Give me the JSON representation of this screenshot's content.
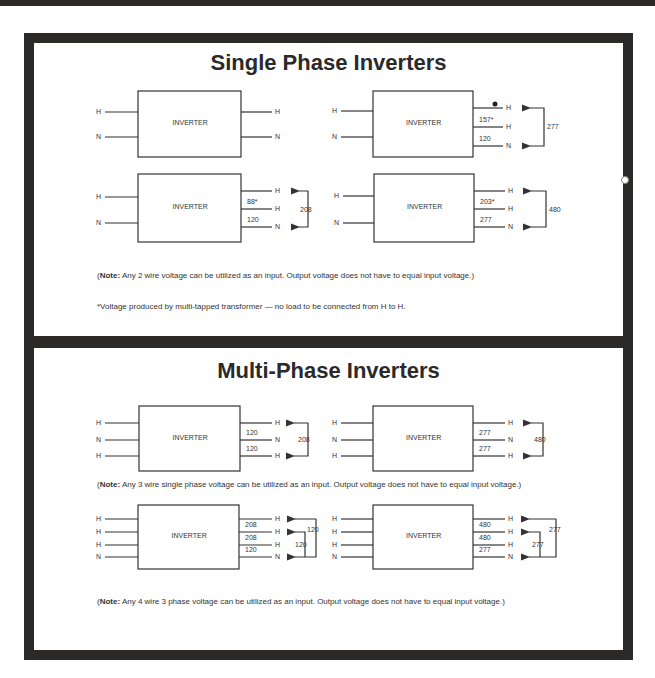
{
  "sections": {
    "single": {
      "title": "Single Phase Inverters",
      "note_label": "Note:",
      "note_text": " Any 2 wire voltage can be utilized as an input. Output voltage does not have to equal input voltage.)",
      "footnote": "*Voltage produced by multi-tapped transformer — no load to be connected from H to H.",
      "diagrams": [
        {
          "box_label": "INVERTER",
          "inputs": [
            "H",
            "N"
          ],
          "outputs": [
            "H",
            "N"
          ],
          "tap_values": [],
          "span_labels": []
        },
        {
          "box_label": "INVERTER",
          "inputs": [
            "H",
            "N"
          ],
          "outputs": [
            "H",
            "H",
            "N"
          ],
          "tap_values": [
            "",
            "157*",
            "120"
          ],
          "span_labels": [
            "277"
          ]
        },
        {
          "box_label": "INVERTER",
          "inputs": [
            "H",
            "N"
          ],
          "outputs": [
            "H",
            "H",
            "N"
          ],
          "tap_values": [
            "",
            "88*",
            "120"
          ],
          "span_labels": [
            "208"
          ]
        },
        {
          "box_label": "INVERTER",
          "inputs": [
            "H",
            "N"
          ],
          "outputs": [
            "H",
            "H",
            "N"
          ],
          "tap_values": [
            "",
            "203*",
            "277"
          ],
          "span_labels": [
            "480"
          ]
        }
      ]
    },
    "multi": {
      "title": "Multi-Phase Inverters",
      "note1_label": "Note:",
      "note1_text": " Any 3 wire single phase voltage can be utilized as an input. Output voltage does not have to equal input voltage.)",
      "note2_label": "Note:",
      "note2_text": " Any 4 wire 3 phase voltage can be utilized as an input. Output voltage does not have to equal input voltage.)",
      "diagrams": [
        {
          "box_label": "INVERTER",
          "inputs": [
            "H",
            "N",
            "H"
          ],
          "outputs": [
            "H",
            "N",
            "H"
          ],
          "tap_values": [
            "",
            "120",
            "120"
          ],
          "span_labels": [
            "208"
          ]
        },
        {
          "box_label": "INVERTER",
          "inputs": [
            "H",
            "N",
            "H"
          ],
          "outputs": [
            "H",
            "N",
            "H"
          ],
          "tap_values": [
            "",
            "277",
            "277"
          ],
          "span_labels": [
            "480"
          ]
        },
        {
          "box_label": "INVERTER",
          "inputs": [
            "H",
            "H",
            "H",
            "N"
          ],
          "outputs": [
            "H",
            "H",
            "H",
            "N"
          ],
          "tap_values": [
            "",
            "208",
            "208",
            "120"
          ],
          "span_labels": [
            "120",
            "120"
          ]
        },
        {
          "box_label": "INVERTER",
          "inputs": [
            "H",
            "H",
            "H",
            "N"
          ],
          "outputs": [
            "H",
            "H",
            "H",
            "N"
          ],
          "tap_values": [
            "",
            "480",
            "480",
            "277"
          ],
          "span_labels": [
            "277",
            "277"
          ]
        }
      ]
    }
  },
  "paren_open": "(",
  "colors": {
    "frame": "#2b2a28",
    "line": "#333333",
    "background": "#ffffff"
  }
}
